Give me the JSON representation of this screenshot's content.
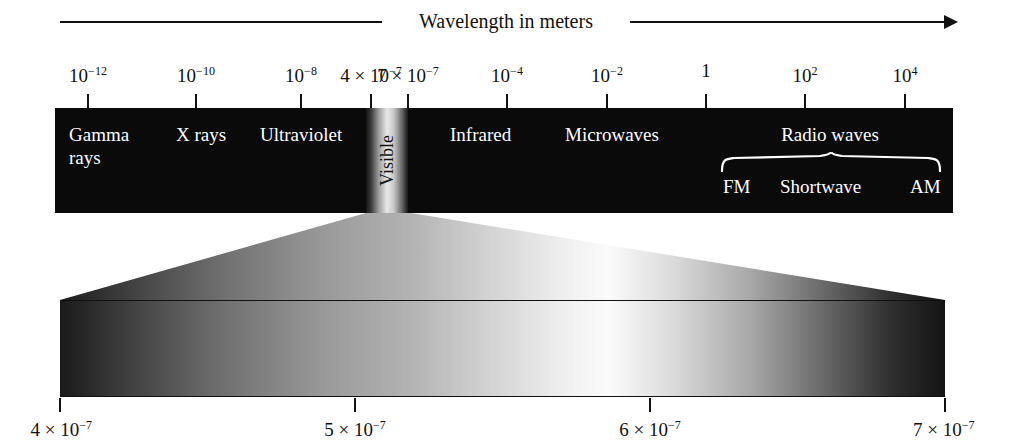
{
  "figure": {
    "caption": "Wavelength in meters"
  },
  "chart_data": {
    "type": "bar",
    "title": "Wavelength in meters",
    "xlabel": "Wavelength in meters",
    "ylabel": "",
    "scale": "log",
    "grid": false,
    "legend_position": "none",
    "top_axis": {
      "tick_labels": [
        "10-12",
        "10-10",
        "10-8",
        "4 x 10-7",
        "7 x 10-7",
        "10-4",
        "10-2",
        "1",
        "102",
        "104"
      ],
      "tick_values": [
        1e-12,
        1e-10,
        1e-08,
        4e-07,
        7e-07,
        0.0001,
        0.01,
        1,
        100,
        10000
      ],
      "tick_px": [
        88,
        196,
        301,
        371,
        408,
        507,
        607,
        706,
        805,
        905
      ]
    },
    "bands": [
      {
        "name": "Gamma rays",
        "lines": [
          "Gamma",
          "rays"
        ],
        "range_m": [
          1e-14,
          1e-11
        ]
      },
      {
        "name": "X rays",
        "lines": [
          "X rays"
        ],
        "range_m": [
          1e-11,
          1e-08
        ]
      },
      {
        "name": "Ultraviolet",
        "lines": [
          "Ultraviolet"
        ],
        "range_m": [
          1e-08,
          4e-07
        ]
      },
      {
        "name": "Visible",
        "lines": [
          "Visible"
        ],
        "range_m": [
          4e-07,
          7e-07
        ]
      },
      {
        "name": "Infrared",
        "lines": [
          "Infrared"
        ],
        "range_m": [
          7e-07,
          0.001
        ]
      },
      {
        "name": "Microwaves",
        "lines": [
          "Microwaves"
        ],
        "range_m": [
          0.001,
          0.1
        ]
      },
      {
        "name": "Radio waves",
        "lines": [
          "Radio waves"
        ],
        "range_m": [
          0.1,
          10000.0
        ],
        "sub_bands": [
          "FM",
          "Shortwave",
          "AM"
        ]
      }
    ],
    "detail_axis": {
      "tick_labels": [
        "4 x 10-7",
        "5 x 10-7",
        "6 x 10-7",
        "7 x 10-7"
      ],
      "tick_values": [
        4e-07,
        5e-07,
        6e-07,
        7e-07
      ],
      "tick_px": [
        60,
        355,
        650,
        945
      ]
    }
  },
  "top_axis": {
    "ticks": [
      {
        "label": "10",
        "exp": "−12",
        "x": 88
      },
      {
        "label": "10",
        "exp": "−10",
        "x": 196
      },
      {
        "label": "10",
        "exp": "−8",
        "x": 301
      },
      {
        "label": "4 × 10",
        "exp": "−7",
        "x": 371
      },
      {
        "label": "7 × 10",
        "exp": "−7",
        "x": 408
      },
      {
        "label": "10",
        "exp": "−4",
        "x": 507
      },
      {
        "label": "10",
        "exp": "−2",
        "x": 607
      },
      {
        "label": "1",
        "exp": "",
        "x": 706
      },
      {
        "label": "10",
        "exp": "2",
        "x": 805
      },
      {
        "label": "10",
        "exp": "4",
        "x": 905
      }
    ]
  },
  "band_labels": {
    "gamma_line1": "Gamma",
    "gamma_line2": "rays",
    "xrays": "X rays",
    "ultraviolet": "Ultraviolet",
    "visible": "Visible",
    "infrared": "Infrared",
    "microwaves": "Microwaves",
    "radio_waves": "Radio waves",
    "fm": "FM",
    "shortwave": "Shortwave",
    "am": "AM"
  },
  "detail_axis": {
    "ticks": [
      {
        "label": "4 × 10",
        "exp": "−7",
        "x": 60
      },
      {
        "label": "5 × 10",
        "exp": "−7",
        "x": 355
      },
      {
        "label": "6 × 10",
        "exp": "−7",
        "x": 650
      },
      {
        "label": "7 × 10",
        "exp": "−7",
        "x": 945
      }
    ]
  },
  "colors": {
    "band_background": "#0a0a0a",
    "band_text": "#ffffff",
    "axis": "#111111",
    "page_background": "#ffffff"
  }
}
